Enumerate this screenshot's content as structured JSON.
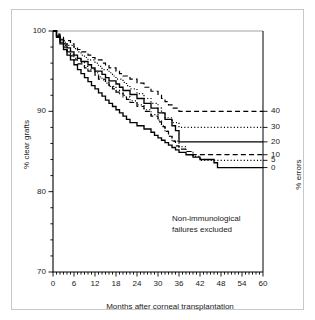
{
  "figure": {
    "annotation_line1": "Non-immunological",
    "annotation_line2": "failures excluded",
    "ylabel_left": "% clear grafts",
    "ylabel_right": "% errors",
    "xlabel": "Months after corneal transplantation"
  },
  "chart_data": {
    "type": "line",
    "title": "",
    "subtitle": "",
    "xlabel": "Months after corneal transplantation",
    "ylabel": "% clear grafts",
    "ylabel_secondary": "% errors",
    "xlim": [
      0,
      60
    ],
    "ylim": [
      70,
      100
    ],
    "xticks": [
      0,
      6,
      12,
      18,
      24,
      30,
      36,
      42,
      48,
      54,
      60
    ],
    "xticklabels": [
      "0",
      "6",
      "12",
      "18",
      "24",
      "30",
      "36",
      "42",
      "48",
      "54",
      "60"
    ],
    "yticks": [
      70,
      80,
      90,
      100
    ],
    "yticklabels": [
      "70",
      "80",
      "90",
      "100"
    ],
    "y_minor_tick_step": 2,
    "x_minor_tick_step": 1,
    "secondary_axis": {
      "labels": [
        "40",
        "30",
        "20",
        "10",
        "5",
        "0"
      ],
      "values": [
        40,
        30,
        20,
        10,
        5,
        0
      ],
      "at_y_percent": [
        90.0,
        88.0,
        86.2,
        84.6,
        83.9,
        83.0
      ]
    },
    "grid": false,
    "legend": "none",
    "annotations": [
      "Non-immunological",
      "failures excluded"
    ],
    "step_interpolation": "post",
    "series": [
      {
        "name": "0 errors",
        "style": "solid",
        "color": "#000000",
        "final_value": 83.0,
        "x": [
          0,
          1,
          2,
          3,
          4,
          5,
          6,
          7,
          8,
          9,
          10,
          11,
          12,
          13,
          14,
          15,
          16,
          17,
          18,
          19,
          20,
          21,
          22,
          24,
          26,
          28,
          29,
          30,
          31,
          32,
          33,
          34,
          35,
          36,
          38,
          40,
          42,
          46,
          47,
          60
        ],
        "y": [
          100,
          99.2,
          98.4,
          97.7,
          97.0,
          96.4,
          95.8,
          95.2,
          94.7,
          94.2,
          93.7,
          93.2,
          92.8,
          92.3,
          91.9,
          91.4,
          91.0,
          90.6,
          90.2,
          89.8,
          89.4,
          89.0,
          88.6,
          88.2,
          87.8,
          87.4,
          87.0,
          86.7,
          86.4,
          86.1,
          85.8,
          85.5,
          85.2,
          84.9,
          84.6,
          84.3,
          84.0,
          83.6,
          83.0,
          83.0
        ]
      },
      {
        "name": "5 errors",
        "style": "dotted",
        "color": "#000000",
        "final_value": 83.9,
        "x": [
          0,
          1,
          2,
          3,
          4,
          5,
          6,
          8,
          9,
          10,
          12,
          13,
          14,
          15,
          16,
          18,
          19,
          20,
          22,
          24,
          26,
          28,
          30,
          31,
          32,
          33,
          34,
          36,
          38,
          40,
          42,
          60
        ],
        "y": [
          100,
          99.4,
          98.8,
          98.2,
          97.6,
          97.1,
          96.6,
          96.1,
          95.6,
          95.2,
          94.8,
          94.3,
          93.9,
          93.5,
          93.1,
          92.6,
          92.2,
          91.8,
          91.3,
          90.8,
          90.2,
          89.6,
          88.9,
          88.2,
          87.5,
          86.9,
          86.3,
          85.6,
          85.0,
          84.4,
          83.9,
          83.9
        ]
      },
      {
        "name": "10 errors",
        "style": "dashed",
        "color": "#000000",
        "final_value": 84.6,
        "x": [
          0,
          1,
          2,
          3,
          4,
          5,
          6,
          7,
          9,
          10,
          12,
          13,
          15,
          16,
          17,
          18,
          20,
          21,
          22,
          24,
          26,
          28,
          30,
          31,
          32,
          33,
          34,
          35,
          36,
          38,
          40,
          60
        ],
        "y": [
          100,
          99.3,
          98.6,
          98.0,
          97.4,
          96.9,
          96.4,
          95.9,
          95.4,
          95.0,
          94.5,
          94.0,
          93.6,
          93.2,
          92.8,
          92.4,
          92.0,
          91.5,
          91.1,
          90.6,
          90.0,
          89.4,
          88.7,
          88.1,
          87.5,
          86.9,
          86.3,
          85.7,
          85.3,
          85.0,
          84.6,
          84.6
        ]
      },
      {
        "name": "20 errors",
        "style": "solid",
        "color": "#000000",
        "final_value": 86.2,
        "x": [
          0,
          1,
          2,
          3,
          4,
          5,
          6,
          7,
          8,
          10,
          11,
          12,
          14,
          15,
          16,
          18,
          19,
          20,
          22,
          24,
          26,
          28,
          30,
          32,
          34,
          35,
          36,
          60
        ],
        "y": [
          100,
          99.4,
          98.9,
          98.4,
          97.9,
          97.4,
          97.0,
          96.6,
          96.2,
          95.8,
          95.4,
          95.0,
          94.6,
          94.2,
          93.8,
          93.4,
          93.0,
          92.6,
          92.1,
          91.6,
          91.0,
          90.4,
          89.8,
          89.0,
          88.2,
          87.6,
          86.2,
          86.2
        ]
      },
      {
        "name": "30 errors",
        "style": "dotted",
        "color": "#000000",
        "final_value": 88.0,
        "x": [
          0,
          1,
          2,
          3,
          4,
          6,
          7,
          8,
          9,
          10,
          12,
          13,
          14,
          16,
          17,
          18,
          20,
          21,
          22,
          24,
          26,
          28,
          30,
          31,
          32,
          34,
          36,
          60
        ],
        "y": [
          100,
          99.5,
          99.0,
          98.6,
          98.2,
          97.8,
          97.4,
          97.0,
          96.7,
          96.4,
          96.0,
          95.6,
          95.2,
          94.8,
          94.4,
          94.0,
          93.6,
          93.2,
          92.8,
          92.2,
          91.6,
          91.0,
          90.4,
          89.8,
          89.2,
          88.6,
          88.0,
          88.0
        ]
      },
      {
        "name": "40 errors",
        "style": "dashed",
        "color": "#000000",
        "final_value": 90.0,
        "x": [
          0,
          1,
          2,
          3,
          5,
          6,
          7,
          8,
          10,
          11,
          12,
          14,
          15,
          16,
          18,
          19,
          20,
          22,
          24,
          26,
          28,
          30,
          31,
          32,
          33,
          34,
          36,
          60
        ],
        "y": [
          100,
          99.6,
          99.2,
          98.8,
          98.4,
          98.0,
          97.7,
          97.4,
          97.0,
          96.7,
          96.4,
          96.0,
          95.7,
          95.4,
          95.0,
          94.7,
          94.4,
          94.0,
          93.5,
          93.0,
          92.5,
          92.0,
          91.6,
          91.2,
          90.8,
          90.4,
          90.0,
          90.0
        ]
      }
    ]
  }
}
